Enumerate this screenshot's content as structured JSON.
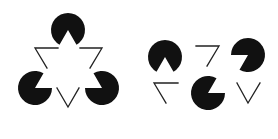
{
  "figure": {
    "colors": {
      "background": "#ffffff",
      "fill": "#111111",
      "stroke": "#222222"
    },
    "panels": [
      {
        "name": "aligned-kanizsa-triangle",
        "label": "Illusory triangle (aligned inducers)"
      },
      {
        "name": "scrambled-kanizsa-elements",
        "label": "Scrambled inducers (no illusory triangle)"
      }
    ]
  }
}
